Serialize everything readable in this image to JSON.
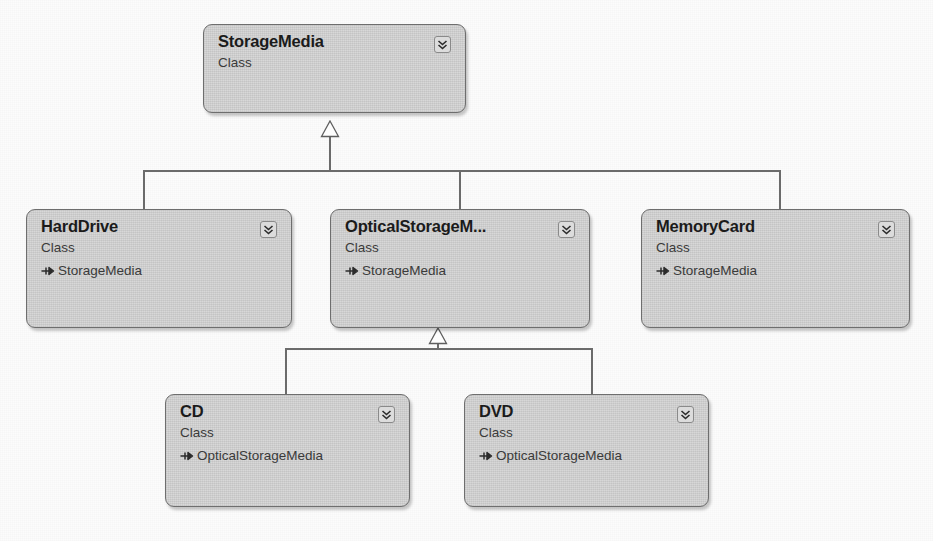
{
  "diagram": {
    "kind_label": "Class",
    "colors": {
      "box_fill": "#d4d4d4",
      "box_border": "#6e6e6e",
      "connector": "#6b6b6b",
      "canvas": "#fcfcfc",
      "name_text": "#1b1b1b",
      "body_text": "#3a3a3a"
    },
    "classes": [
      {
        "id": "storagemedia",
        "name": "StorageMedia",
        "kind": "Class",
        "base": "",
        "chevron_icon": "double-chevron-down-icon"
      },
      {
        "id": "harddrive",
        "name": "HardDrive",
        "kind": "Class",
        "base": "StorageMedia",
        "chevron_icon": "double-chevron-down-icon"
      },
      {
        "id": "opticalstoragemedia",
        "name": "OpticalStorageM...",
        "kind": "Class",
        "base": "StorageMedia",
        "chevron_icon": "double-chevron-down-icon"
      },
      {
        "id": "memorycard",
        "name": "MemoryCard",
        "kind": "Class",
        "base": "StorageMedia",
        "chevron_icon": "double-chevron-down-icon"
      },
      {
        "id": "cd",
        "name": "CD",
        "kind": "Class",
        "base": "OpticalStorageMedia",
        "chevron_icon": "double-chevron-down-icon"
      },
      {
        "id": "dvd",
        "name": "DVD",
        "kind": "Class",
        "base": "OpticalStorageMedia",
        "chevron_icon": "double-chevron-down-icon"
      }
    ]
  }
}
